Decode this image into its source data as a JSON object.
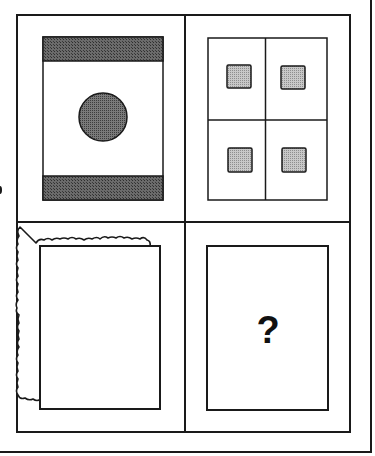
{
  "puzzle": {
    "type": "matrix-reasoning-2x2",
    "colors": {
      "line": "#1a1a1a",
      "dark_fill": "#555555",
      "circle_fill": "#6a6a6a",
      "square_fill": "#b5b5b5",
      "background": "#ffffff"
    },
    "cells": [
      {
        "position": "top-left",
        "description": "rectangle with dark bars at top and bottom and shaded circle in center"
      },
      {
        "position": "top-right",
        "description": "rectangle divided into four quadrants, each with a small shaded square"
      },
      {
        "position": "bottom-left",
        "description": "rectangle with wavy decorative outer border"
      },
      {
        "position": "bottom-right",
        "description": "rectangle containing question mark",
        "label": "?"
      }
    ]
  }
}
